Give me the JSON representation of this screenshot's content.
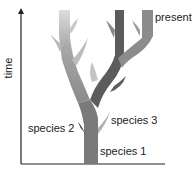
{
  "diagram": {
    "type": "phylogenetic-tree",
    "axis": {
      "ylabel": "time",
      "direction": "up"
    },
    "labels": {
      "present": "present",
      "species1": "species 1",
      "species2": "species 2",
      "species3": "species 3"
    },
    "colors": {
      "trunk": "#7a7a7a",
      "left_branch": "#9a9a9a",
      "left_branch_top": "#d6d6d6",
      "middle_branch": "#5c5c5c",
      "right_branch": "#8c8c8c",
      "species2_spur": "#2f2f2f",
      "species3_spur": "#b0b0b0",
      "axis": "#222222"
    }
  }
}
